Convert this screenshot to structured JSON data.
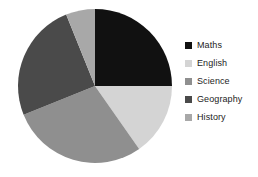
{
  "chart_data": {
    "type": "pie",
    "title": "",
    "categories": [
      "Maths",
      "English",
      "Science",
      "Geography",
      "History"
    ],
    "values": [
      25,
      15,
      29,
      25,
      6
    ],
    "unit": "percent",
    "start_angle_deg": 0,
    "direction": "clockwise",
    "slice_angles_deg": [
      90,
      55,
      103,
      90,
      22
    ],
    "colors": [
      "#111111",
      "#d4d4d4",
      "#8f8f8f",
      "#4a4a4a",
      "#a8a8a8"
    ],
    "legend": {
      "position": "right",
      "entries": [
        {
          "label": "Maths",
          "color": "#111111",
          "value": 25
        },
        {
          "label": "English",
          "color": "#d4d4d4",
          "value": 15
        },
        {
          "label": "Science",
          "color": "#8f8f8f",
          "value": 29
        },
        {
          "label": "Geography",
          "color": "#4a4a4a",
          "value": 25
        },
        {
          "label": "History",
          "color": "#a8a8a8",
          "value": 6
        }
      ]
    },
    "grid": false,
    "xlabel": "",
    "ylabel": "",
    "background": "#ffffff"
  },
  "geometry": {
    "center_x": 95,
    "center_y": 86,
    "radius": 77
  }
}
